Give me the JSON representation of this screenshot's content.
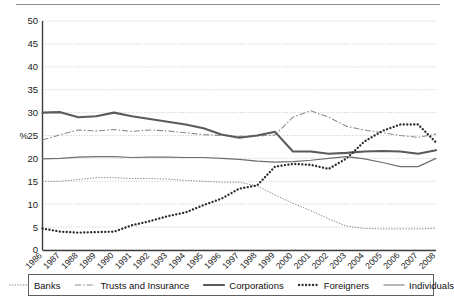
{
  "chart_data": {
    "type": "line",
    "title": "",
    "xlabel": "",
    "ylabel": "%",
    "ylim": [
      0,
      50
    ],
    "yticks": [
      0,
      5,
      10,
      15,
      20,
      25,
      30,
      35,
      40,
      45,
      50
    ],
    "grid": true,
    "legend_position": "bottom",
    "categories": [
      "1986",
      "1987",
      "1988",
      "1989",
      "1990",
      "1991",
      "1992",
      "1993",
      "1994",
      "1995",
      "1996",
      "1997",
      "1998",
      "1999",
      "2000",
      "2001",
      "2002",
      "2003",
      "2004",
      "2005",
      "2006",
      "2007",
      "2008"
    ],
    "series": [
      {
        "name": "Banks",
        "style": "fine-dotted",
        "color": "#8a8a8a",
        "values": [
          15.0,
          15.0,
          15.4,
          15.8,
          15.8,
          15.6,
          15.6,
          15.5,
          15.2,
          15.0,
          14.8,
          14.8,
          14.0,
          12.0,
          10.2,
          8.6,
          6.8,
          5.2,
          4.7,
          4.6,
          4.6,
          4.6,
          4.7
        ]
      },
      {
        "name": "Trusts and Insurance",
        "style": "dash-dot",
        "color": "#8a8a8a",
        "values": [
          24.0,
          25.2,
          26.2,
          26.0,
          26.3,
          25.9,
          26.2,
          26.0,
          25.6,
          25.2,
          25.0,
          24.8,
          24.9,
          25.1,
          29.0,
          30.4,
          29.0,
          27.0,
          26.2,
          25.6,
          25.0,
          24.6,
          25.3
        ]
      },
      {
        "name": "Corporations",
        "style": "solid-thick",
        "color": "#5a5a5a",
        "values": [
          30.0,
          30.1,
          29.0,
          29.2,
          30.0,
          29.2,
          28.6,
          28.0,
          27.4,
          26.6,
          25.2,
          24.5,
          25.0,
          25.8,
          21.5,
          21.5,
          21.0,
          21.2,
          21.5,
          21.6,
          21.5,
          21.0,
          21.8
        ]
      },
      {
        "name": "Foreigners",
        "style": "thick-dotted",
        "color": "#2b2b2b",
        "values": [
          4.7,
          4.0,
          3.8,
          3.9,
          4.0,
          5.4,
          6.3,
          7.4,
          8.2,
          9.8,
          11.2,
          13.4,
          14.1,
          18.2,
          18.8,
          18.6,
          17.7,
          20.0,
          23.7,
          26.0,
          27.4,
          27.4,
          23.5
        ]
      },
      {
        "name": "Individuals",
        "style": "solid-thin",
        "color": "#6e6e6e",
        "values": [
          19.9,
          20.0,
          20.3,
          20.4,
          20.4,
          20.2,
          20.3,
          20.3,
          20.2,
          20.2,
          20.0,
          19.8,
          19.4,
          19.2,
          19.3,
          19.6,
          20.0,
          20.4,
          19.9,
          19.1,
          18.2,
          18.2,
          20.0
        ]
      }
    ]
  },
  "legend": {
    "items": [
      {
        "label": "Banks",
        "style": "fine-dotted"
      },
      {
        "label": "Trusts and Insurance",
        "style": "dash-dot"
      },
      {
        "label": "Corporations",
        "style": "solid-thick"
      },
      {
        "label": "Foreigners",
        "style": "thick-dotted"
      },
      {
        "label": "Individuals",
        "style": "solid-thin"
      }
    ]
  }
}
